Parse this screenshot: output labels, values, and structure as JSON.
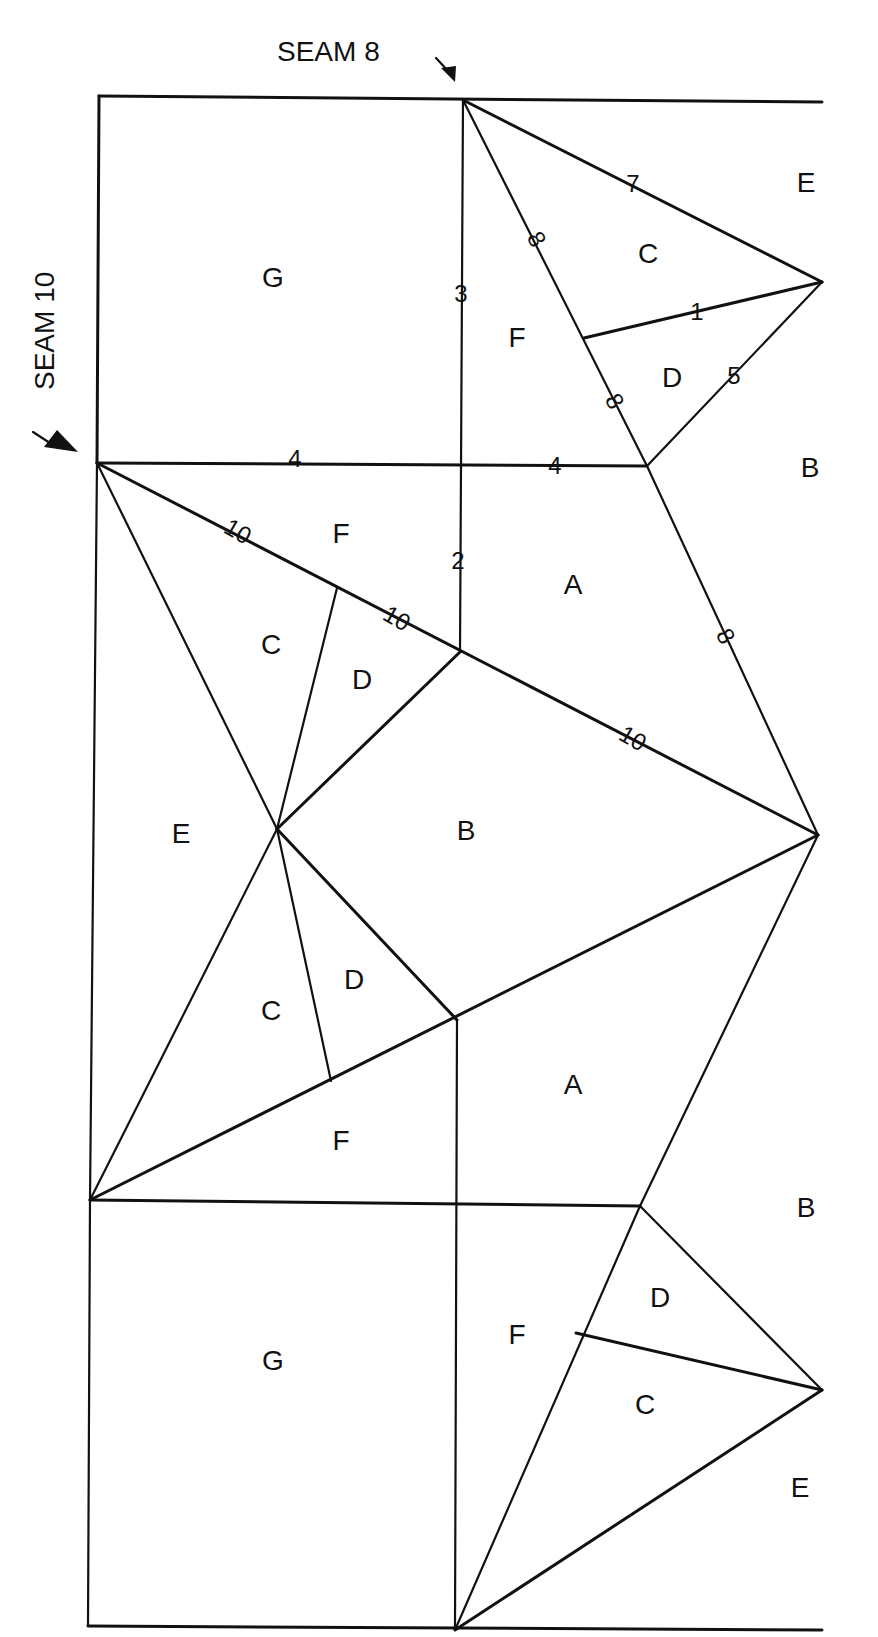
{
  "seams": {
    "top": {
      "label": "SEAM 8"
    },
    "left": {
      "label": "SEAM 10"
    }
  },
  "regions": [
    {
      "id": "G-top",
      "label": "G",
      "x": 273,
      "y": 280
    },
    {
      "id": "F-top",
      "label": "F",
      "x": 517,
      "y": 340
    },
    {
      "id": "C-top",
      "label": "C",
      "x": 648,
      "y": 256
    },
    {
      "id": "D-top",
      "label": "D",
      "x": 672,
      "y": 380
    },
    {
      "id": "E-topright",
      "label": "E",
      "x": 806,
      "y": 185
    },
    {
      "id": "B-right-upper",
      "label": "B",
      "x": 810,
      "y": 470
    },
    {
      "id": "F-mid-upper",
      "label": "F",
      "x": 341,
      "y": 536
    },
    {
      "id": "A-upper",
      "label": "A",
      "x": 573,
      "y": 587
    },
    {
      "id": "C-mid-upper",
      "label": "C",
      "x": 271,
      "y": 647
    },
    {
      "id": "D-mid-upper",
      "label": "D",
      "x": 362,
      "y": 682
    },
    {
      "id": "E-left",
      "label": "E",
      "x": 181,
      "y": 836
    },
    {
      "id": "B-center",
      "label": "B",
      "x": 466,
      "y": 833
    },
    {
      "id": "D-mid-lower",
      "label": "D",
      "x": 354,
      "y": 982
    },
    {
      "id": "C-mid-lower",
      "label": "C",
      "x": 271,
      "y": 1013
    },
    {
      "id": "A-lower",
      "label": "A",
      "x": 573,
      "y": 1087
    },
    {
      "id": "F-mid-lower",
      "label": "F",
      "x": 341,
      "y": 1143
    },
    {
      "id": "B-right-lower",
      "label": "B",
      "x": 806,
      "y": 1210
    },
    {
      "id": "D-bottom",
      "label": "D",
      "x": 660,
      "y": 1300
    },
    {
      "id": "F-bottom",
      "label": "F",
      "x": 517,
      "y": 1337
    },
    {
      "id": "G-bottom",
      "label": "G",
      "x": 273,
      "y": 1363
    },
    {
      "id": "C-bottom",
      "label": "C",
      "x": 645,
      "y": 1407
    },
    {
      "id": "E-bottomright",
      "label": "E",
      "x": 800,
      "y": 1490
    }
  ],
  "edge_marks": [
    {
      "label": "7",
      "x": 633,
      "y": 186,
      "rotate": 0
    },
    {
      "label": "8",
      "x": 535,
      "y": 240,
      "rotate": 60
    },
    {
      "label": "3",
      "x": 461,
      "y": 296,
      "rotate": 0
    },
    {
      "label": "1",
      "x": 697,
      "y": 314,
      "rotate": 0
    },
    {
      "label": "5",
      "x": 734,
      "y": 378,
      "rotate": 0
    },
    {
      "label": "8",
      "x": 613,
      "y": 402,
      "rotate": 60
    },
    {
      "label": "4",
      "x": 295,
      "y": 461,
      "rotate": 0
    },
    {
      "label": "4",
      "x": 555,
      "y": 468,
      "rotate": 0
    },
    {
      "label": "10",
      "x": 237,
      "y": 533,
      "rotate": 30
    },
    {
      "label": "2",
      "x": 458,
      "y": 563,
      "rotate": 0
    },
    {
      "label": "10",
      "x": 396,
      "y": 620,
      "rotate": 30
    },
    {
      "label": "8",
      "x": 724,
      "y": 637,
      "rotate": 60
    },
    {
      "label": "10",
      "x": 632,
      "y": 740,
      "rotate": 30
    }
  ],
  "colors": {
    "line": "#111111",
    "background": "#ffffff"
  }
}
